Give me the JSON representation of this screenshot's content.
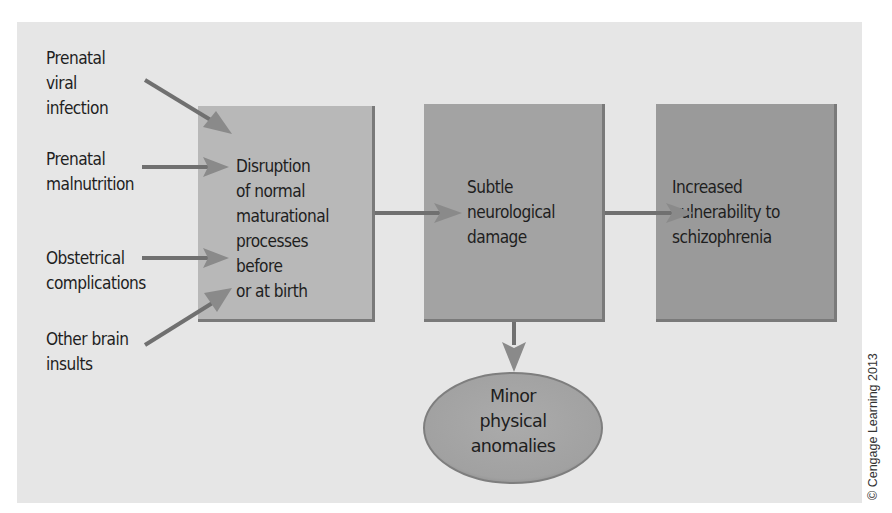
{
  "diagram": {
    "type": "flowchart",
    "causes": [
      {
        "id": "cause-viral",
        "label": "Prenatal\nviral\ninfection"
      },
      {
        "id": "cause-malnutrition",
        "label": "Prenatal\nmalnutrition"
      },
      {
        "id": "cause-obstetrical",
        "label": "Obstetrical\ncomplications"
      },
      {
        "id": "cause-brain-insults",
        "label": "Other brain\ninsults"
      }
    ],
    "nodes": [
      {
        "id": "disruption",
        "label": "Disruption\nof normal\nmaturational\nprocesses before\nor at birth",
        "fill": "#b8b8b8"
      },
      {
        "id": "neuro-damage",
        "label": "Subtle\nneurological\ndamage",
        "fill": "#a3a3a3"
      },
      {
        "id": "vulnerability",
        "label": "Increased\nvulnerability to\nschizophrenia",
        "fill": "#9a9a9a"
      }
    ],
    "outcome": {
      "id": "anomalies",
      "label": "Minor\nphysical\nanomalies",
      "shape": "ellipse",
      "fill": "#a6a6a6"
    },
    "edges": [
      {
        "from": "cause-viral",
        "to": "disruption"
      },
      {
        "from": "cause-malnutrition",
        "to": "disruption"
      },
      {
        "from": "cause-obstetrical",
        "to": "disruption"
      },
      {
        "from": "cause-brain-insults",
        "to": "disruption"
      },
      {
        "from": "disruption",
        "to": "neuro-damage"
      },
      {
        "from": "neuro-damage",
        "to": "vulnerability"
      },
      {
        "from": "neuro-damage",
        "to": "anomalies"
      }
    ],
    "copyright": "© Cengage Learning 2013"
  }
}
